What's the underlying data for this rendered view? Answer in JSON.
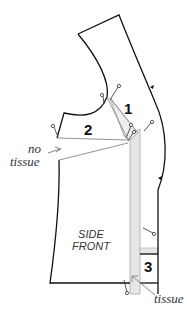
{
  "diagram": {
    "pattern_piece_label_line1": "SIDE",
    "pattern_piece_label_line2": "FRONT",
    "steps": [
      {
        "number": "1"
      },
      {
        "number": "2"
      },
      {
        "number": "3"
      }
    ],
    "annotations": {
      "no_tissue_line1": "no",
      "no_tissue_line2": "tissue",
      "tissue": "tissue"
    },
    "colors": {
      "outline": "#111111",
      "tissue_fill": "#e6e6e6",
      "tissue_edge": "#9a9a9a",
      "arrow": "#888888",
      "pin": "#444444"
    }
  }
}
